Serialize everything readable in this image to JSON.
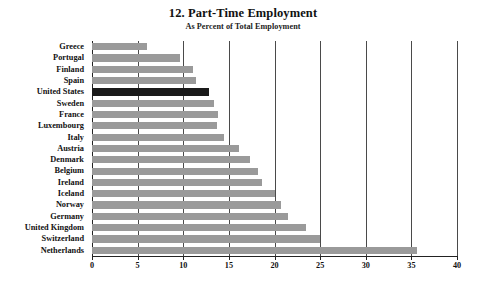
{
  "chart_data": {
    "type": "bar",
    "orientation": "horizontal",
    "title": "12. Part-Time Employment",
    "subtitle": "As Percent of Total Employment",
    "xlabel": "",
    "ylabel": "",
    "xlim": [
      0,
      40
    ],
    "xticks": [
      0,
      5,
      10,
      15,
      20,
      25,
      30,
      35,
      40
    ],
    "xtick_labels": [
      "0",
      "5",
      "10",
      "15",
      "20",
      "25",
      "30",
      "35",
      "40"
    ],
    "grid": "vertical",
    "legend": "none",
    "bar_color": "#9a9a9a",
    "highlight_color": "#1a1a1a",
    "highlight_category": "United States",
    "categories": [
      "Greece",
      "Portugal",
      "Finland",
      "Spain",
      "United States",
      "Sweden",
      "France",
      "Luxembourg",
      "Italy",
      "Austria",
      "Denmark",
      "Belgium",
      "Ireland",
      "Iceland",
      "Norway",
      "Germany",
      "United Kingdom",
      "Switzerland",
      "Netherlands"
    ],
    "values": [
      6.0,
      9.6,
      11.1,
      11.4,
      12.8,
      13.4,
      13.8,
      13.7,
      14.5,
      16.1,
      17.3,
      18.2,
      18.6,
      20.1,
      20.7,
      21.5,
      23.5,
      25.0,
      35.6
    ]
  }
}
